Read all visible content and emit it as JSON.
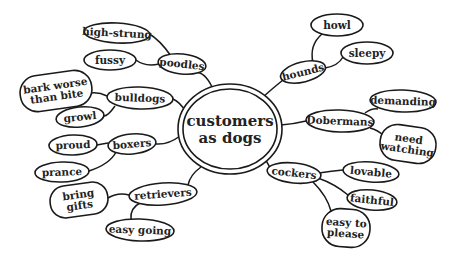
{
  "diagram": {
    "type": "mind-map",
    "center": {
      "id": "center",
      "lines": [
        "customers",
        "as dogs"
      ],
      "x": 230,
      "y": 129,
      "rx": 52,
      "ry": 45
    },
    "nodes": [
      {
        "id": "poodles",
        "lines": [
          "poodles"
        ],
        "x": 182,
        "y": 64,
        "rx": 24,
        "ry": 10,
        "rot": 6
      },
      {
        "id": "high-strung",
        "lines": [
          "high-strung"
        ],
        "x": 117,
        "y": 33,
        "rx": 33,
        "ry": 10,
        "rot": 3
      },
      {
        "id": "fussy",
        "lines": [
          "fussy"
        ],
        "x": 110,
        "y": 60,
        "rx": 26,
        "ry": 10,
        "rot": 0
      },
      {
        "id": "bulldogs",
        "lines": [
          "bulldogs"
        ],
        "x": 140,
        "y": 98,
        "rx": 33,
        "ry": 11,
        "rot": 2
      },
      {
        "id": "bark-worse-than-bite",
        "lines": [
          "bark worse",
          "than bite"
        ],
        "x": 56,
        "y": 91,
        "rx": 36,
        "ry": 18,
        "rot": -8
      },
      {
        "id": "growl",
        "lines": [
          "growl"
        ],
        "x": 80,
        "y": 117,
        "rx": 24,
        "ry": 10,
        "rot": -6
      },
      {
        "id": "boxers",
        "lines": [
          "boxers"
        ],
        "x": 132,
        "y": 144,
        "rx": 24,
        "ry": 10,
        "rot": -5
      },
      {
        "id": "proud",
        "lines": [
          "proud"
        ],
        "x": 73,
        "y": 145,
        "rx": 24,
        "ry": 10,
        "rot": -2
      },
      {
        "id": "prance",
        "lines": [
          "prance"
        ],
        "x": 62,
        "y": 172,
        "rx": 27,
        "ry": 10,
        "rot": -2
      },
      {
        "id": "retrievers",
        "lines": [
          "retrievers"
        ],
        "x": 163,
        "y": 194,
        "rx": 34,
        "ry": 11,
        "rot": -4
      },
      {
        "id": "bring-gifts",
        "lines": [
          "bring",
          "gifts"
        ],
        "x": 79,
        "y": 200,
        "rx": 29,
        "ry": 16,
        "rot": -8
      },
      {
        "id": "easy-going",
        "lines": [
          "easy going"
        ],
        "x": 140,
        "y": 230,
        "rx": 34,
        "ry": 11,
        "rot": 2
      },
      {
        "id": "hounds",
        "lines": [
          "hounds"
        ],
        "x": 303,
        "y": 72,
        "rx": 23,
        "ry": 10,
        "rot": -14
      },
      {
        "id": "howl",
        "lines": [
          "howl"
        ],
        "x": 337,
        "y": 25,
        "rx": 26,
        "ry": 11,
        "rot": 0
      },
      {
        "id": "sleepy",
        "lines": [
          "sleepy"
        ],
        "x": 367,
        "y": 53,
        "rx": 26,
        "ry": 11,
        "rot": 0
      },
      {
        "id": "dobermans",
        "lines": [
          "Dobermans"
        ],
        "x": 340,
        "y": 121,
        "rx": 34,
        "ry": 11,
        "rot": 2
      },
      {
        "id": "demanding",
        "lines": [
          "demanding"
        ],
        "x": 403,
        "y": 101,
        "rx": 33,
        "ry": 11,
        "rot": 2
      },
      {
        "id": "need-watching",
        "lines": [
          "need",
          "watching"
        ],
        "x": 408,
        "y": 144,
        "rx": 28,
        "ry": 18,
        "rot": 8
      },
      {
        "id": "cockers",
        "lines": [
          "cockers"
        ],
        "x": 294,
        "y": 173,
        "rx": 27,
        "ry": 10,
        "rot": 6
      },
      {
        "id": "lovable",
        "lines": [
          "lovable"
        ],
        "x": 371,
        "y": 172,
        "rx": 28,
        "ry": 10,
        "rot": 5
      },
      {
        "id": "faithful",
        "lines": [
          "faithful"
        ],
        "x": 372,
        "y": 200,
        "rx": 25,
        "ry": 10,
        "rot": 6
      },
      {
        "id": "easy-to-please",
        "lines": [
          "easy to",
          "please"
        ],
        "x": 346,
        "y": 228,
        "rx": 24,
        "ry": 19,
        "rot": 4
      }
    ],
    "edges": [
      {
        "from": "center",
        "to": "poodles",
        "d": "M 212 87 Q 205 72 195 72"
      },
      {
        "from": "poodles",
        "to": "high-strung",
        "d": "M 171 56 Q 160 40 148 33"
      },
      {
        "from": "poodles",
        "to": "fussy",
        "d": "M 159 64 Q 145 67 136 60"
      },
      {
        "from": "center",
        "to": "bulldogs",
        "d": "M 186 112 Q 180 102 173 99"
      },
      {
        "from": "bulldogs",
        "to": "bark-worse-than-bite",
        "d": "M 107 96 Q 99 92 91 93"
      },
      {
        "from": "bulldogs",
        "to": "growl",
        "d": "M 115 106 Q 108 116 104 116"
      },
      {
        "from": "center",
        "to": "boxers",
        "d": "M 180 136 Q 168 145 156 144"
      },
      {
        "from": "boxers",
        "to": "proud",
        "d": "M 108 143 Q 102 144 97 145"
      },
      {
        "from": "boxers",
        "to": "prance",
        "d": "M 116 152 Q 110 164 89 171"
      },
      {
        "from": "center",
        "to": "retrievers",
        "d": "M 201 167 Q 190 175 188 185"
      },
      {
        "from": "retrievers",
        "to": "bring-gifts",
        "d": "M 129 195 Q 118 192 108 198"
      },
      {
        "from": "retrievers",
        "to": "easy-going",
        "d": "M 140 203 Q 130 208 131 219"
      },
      {
        "from": "center",
        "to": "hounds",
        "d": "M 263 97 Q 273 88 283 80"
      },
      {
        "from": "hounds",
        "to": "howl",
        "d": "M 313 63 Q 309 45 322 34"
      },
      {
        "from": "hounds",
        "to": "sleepy",
        "d": "M 325 68 Q 338 66 343 57"
      },
      {
        "from": "center",
        "to": "dobermans",
        "d": "M 281 125 Q 294 124 306 121"
      },
      {
        "from": "dobermans",
        "to": "demanding",
        "d": "M 365 113 Q 372 108 378 109"
      },
      {
        "from": "dobermans",
        "to": "need-watching",
        "d": "M 370 128 Q 378 130 384 136"
      },
      {
        "from": "center",
        "to": "cockers",
        "d": "M 262 155 Q 268 163 270 168"
      },
      {
        "from": "cockers",
        "to": "lovable",
        "d": "M 319 173 Q 332 171 343 170"
      },
      {
        "from": "cockers",
        "to": "faithful",
        "d": "M 318 178 Q 335 184 348 195"
      },
      {
        "from": "cockers",
        "to": "easy-to-please",
        "d": "M 313 182 Q 327 196 331 211"
      }
    ]
  }
}
